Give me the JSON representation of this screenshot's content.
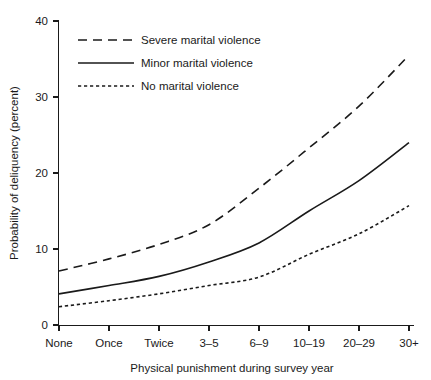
{
  "chart_data": {
    "type": "line",
    "title": "",
    "xlabel": "Physical punishment during survey year",
    "ylabel": "Probability of deliquency (percent)",
    "categories": [
      "None",
      "Once",
      "Twice",
      "3–5",
      "6–9",
      "10–19",
      "20–29",
      "30+"
    ],
    "ylim": [
      0,
      40
    ],
    "yticks": [
      0,
      10,
      20,
      30,
      40
    ],
    "ytick_labels": [
      "0",
      "10",
      "20",
      "30",
      "40"
    ],
    "grid": false,
    "legend_position": "top-left",
    "series": [
      {
        "name": "Severe marital violence",
        "style": "long-dashed",
        "values": [
          7.1,
          8.7,
          10.6,
          13.2,
          18.0,
          23.3,
          28.8,
          35.5
        ]
      },
      {
        "name": "Minor marital violence",
        "style": "solid",
        "values": [
          4.1,
          5.2,
          6.4,
          8.3,
          10.8,
          15.0,
          19.0,
          24.0
        ]
      },
      {
        "name": "No marital violence",
        "style": "dotted",
        "values": [
          2.4,
          3.2,
          4.1,
          5.2,
          6.3,
          9.3,
          12.0,
          15.7
        ]
      }
    ]
  },
  "axes": {
    "y_label": "Probability of deliquency (percent)",
    "x_label": "Physical punishment during survey year",
    "y_ticks": [
      "40",
      "30",
      "20",
      "10",
      "0"
    ],
    "x_ticks": [
      "None",
      "Once",
      "Twice",
      "3–5",
      "6–9",
      "10–19",
      "20–29",
      "30+"
    ]
  },
  "legend": {
    "entries": [
      {
        "label": "Severe marital violence",
        "style": "long-dashed"
      },
      {
        "label": "Minor marital violence",
        "style": "solid"
      },
      {
        "label": "No marital violence",
        "style": "dotted"
      }
    ]
  },
  "colors": {
    "ink": "#1a1a1a",
    "background": "#ffffff"
  }
}
